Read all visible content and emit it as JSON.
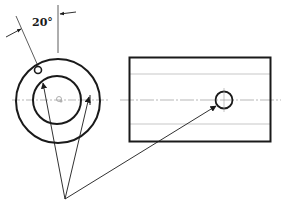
{
  "figure": {
    "angle_label": "20°",
    "colors": {
      "stroke": "#1a1a1a",
      "thin_line": "#4a4a4a",
      "center_line": "#9a9a9a",
      "background": "#ffffff"
    },
    "views": [
      {
        "name": "end-view",
        "shape": "concentric-circles"
      },
      {
        "name": "side-view",
        "shape": "rectangle-with-hole"
      }
    ]
  }
}
